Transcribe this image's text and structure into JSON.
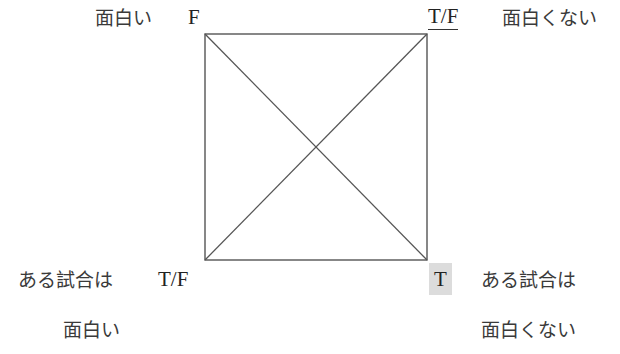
{
  "diagram": {
    "type": "square-of-opposition",
    "stroke_color": "#555555",
    "highlight_color": "#dcdcdc",
    "corners": {
      "top_left": {
        "proposition": "面白い",
        "truth_value": "F"
      },
      "top_right": {
        "proposition": "面白くない",
        "truth_value": "T/F",
        "truth_value_underlined": true
      },
      "bottom_left": {
        "proposition_line1": "ある試合は",
        "proposition_line2": "面白い",
        "truth_value": "T/F"
      },
      "bottom_right": {
        "proposition_line1": "ある試合は",
        "proposition_line2": "面白くない",
        "truth_value": "T",
        "truth_value_highlighted": true
      }
    }
  }
}
